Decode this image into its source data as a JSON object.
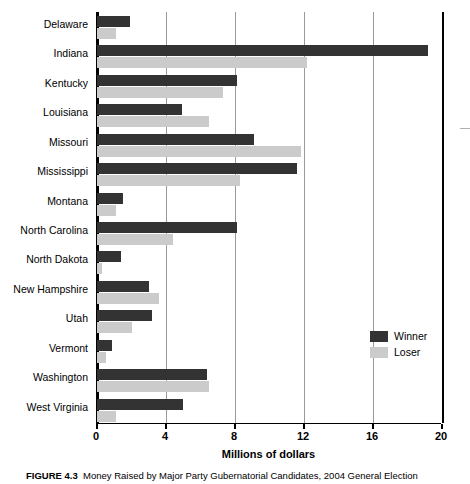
{
  "figure": {
    "caption_number": "FIGURE 4.3",
    "caption_text": "Money Raised by Major Party Gubernatorial Candidates, 2004 General Election"
  },
  "legend": {
    "position": "inside-right",
    "entries": [
      {
        "label": "Winner",
        "color": "#333333"
      },
      {
        "label": "Loser",
        "color": "#cbcbcb"
      }
    ]
  },
  "axis": {
    "x_title": "Millions of dollars",
    "x_ticks": [
      "0",
      "4",
      "8",
      "12",
      "16",
      "20"
    ]
  },
  "chart_data": {
    "type": "bar",
    "orientation": "horizontal",
    "title": "",
    "subtitle": "",
    "xlabel": "Millions of dollars",
    "ylabel": "",
    "xlim": [
      0,
      20
    ],
    "xticks": [
      0,
      4,
      8,
      12,
      16,
      20
    ],
    "grid": true,
    "grid_axis": "x",
    "legend_position": "inside-right",
    "categories": [
      "Delaware",
      "Indiana",
      "Kentucky",
      "Louisiana",
      "Missouri",
      "Mississippi",
      "Montana",
      "North Carolina",
      "North Dakota",
      "New Hampshire",
      "Utah",
      "Vermont",
      "Washington",
      "West Virginia"
    ],
    "series": [
      {
        "name": "Winner",
        "color": "#333333",
        "values": [
          1.9,
          19.2,
          8.1,
          4.9,
          9.1,
          11.6,
          1.5,
          8.1,
          1.4,
          3.0,
          3.2,
          0.85,
          6.4,
          5.0
        ]
      },
      {
        "name": "Loser",
        "color": "#cbcbcb",
        "values": [
          1.1,
          12.2,
          7.3,
          6.5,
          11.8,
          8.3,
          1.1,
          4.4,
          0.3,
          3.6,
          2.0,
          0.5,
          6.5,
          1.1
        ]
      }
    ]
  }
}
